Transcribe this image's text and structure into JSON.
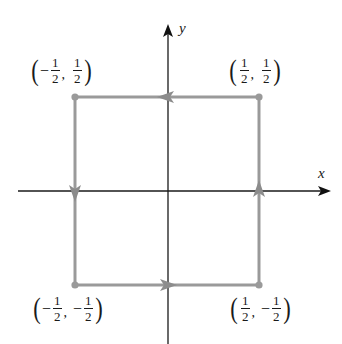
{
  "axes": {
    "x_label": "x",
    "y_label": "y",
    "color": "#1a1a1a"
  },
  "path": {
    "color": "#9a9a9a",
    "orientation": "counterclockwise",
    "vertices": [
      {
        "x": 0.5,
        "y": -0.5
      },
      {
        "x": 0.5,
        "y": 0.5
      },
      {
        "x": -0.5,
        "y": 0.5
      },
      {
        "x": -0.5,
        "y": -0.5
      }
    ],
    "edges": [
      {
        "from": "(1/2, -1/2)",
        "to": "(1/2, 1/2)",
        "direction": "up"
      },
      {
        "from": "(1/2, 1/2)",
        "to": "(-1/2, 1/2)",
        "direction": "left"
      },
      {
        "from": "(-1/2, 1/2)",
        "to": "(-1/2, -1/2)",
        "direction": "down"
      },
      {
        "from": "(-1/2, -1/2)",
        "to": "(1/2, -1/2)",
        "direction": "right"
      }
    ]
  },
  "labels": {
    "top_left": {
      "open": "(",
      "x_sign": "−",
      "x_num": "1",
      "x_den": "2",
      "comma": ",",
      "y_sign": "",
      "y_num": "1",
      "y_den": "2",
      "close": ")"
    },
    "top_right": {
      "open": "(",
      "x_sign": "",
      "x_num": "1",
      "x_den": "2",
      "comma": ",",
      "y_sign": "",
      "y_num": "1",
      "y_den": "2",
      "close": ")"
    },
    "bottom_left": {
      "open": "(",
      "x_sign": "−",
      "x_num": "1",
      "x_den": "2",
      "comma": ",",
      "y_sign": "−",
      "y_num": "1",
      "y_den": "2",
      "close": ")"
    },
    "bottom_right": {
      "open": "(",
      "x_sign": "",
      "x_num": "1",
      "x_den": "2",
      "comma": ",",
      "y_sign": "−",
      "y_num": "1",
      "y_den": "2",
      "close": ")"
    }
  }
}
